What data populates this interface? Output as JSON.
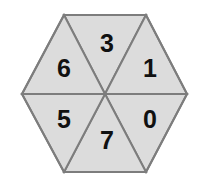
{
  "figure": {
    "shape": "hexagon",
    "sector_count": 6,
    "background_color": "#ffffff",
    "fill_color": "#dcdcdc",
    "stroke_color": "#7d7d7d",
    "label_color": "#111111",
    "stroke_width": 2
  },
  "geometry": {
    "center": {
      "x": 105,
      "y": 94
    },
    "vertices": [
      {
        "name": "left",
        "x": 22,
        "y": 94
      },
      {
        "name": "top-left",
        "x": 64,
        "y": 15
      },
      {
        "name": "top-right",
        "x": 146,
        "y": 15
      },
      {
        "name": "right",
        "x": 187,
        "y": 94
      },
      {
        "name": "bottom-right",
        "x": 146,
        "y": 172
      },
      {
        "name": "bottom-left",
        "x": 64,
        "y": 172
      }
    ]
  },
  "chart_data": {
    "type": "pie",
    "categories": [
      "3",
      "1",
      "0",
      "7",
      "5",
      "6"
    ],
    "values": [
      1,
      1,
      1,
      1,
      1,
      1
    ],
    "legend": "none",
    "grid": false
  },
  "sectors": [
    {
      "id": "top",
      "label": "3",
      "points": "64,15 146,15 105,94",
      "label_x": 107,
      "label_y": 45
    },
    {
      "id": "upper-right",
      "label": "1",
      "points": "146,15 187,94 105,94",
      "label_x": 150,
      "label_y": 70
    },
    {
      "id": "lower-right",
      "label": "0",
      "points": "187,94 146,172 105,94",
      "label_x": 150,
      "label_y": 121
    },
    {
      "id": "bottom",
      "label": "7",
      "points": "146,172 64,172 105,94",
      "label_x": 107,
      "label_y": 142
    },
    {
      "id": "lower-left",
      "label": "5",
      "points": "64,172 22,94 105,94",
      "label_x": 64,
      "label_y": 121
    },
    {
      "id": "upper-left",
      "label": "6",
      "points": "22,94 64,15 105,94",
      "label_x": 64,
      "label_y": 70
    }
  ]
}
